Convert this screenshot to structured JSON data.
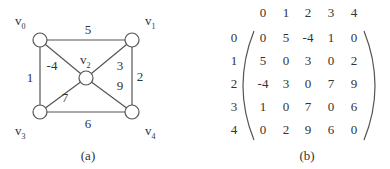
{
  "graph": {
    "caption": "(a)",
    "vertices": [
      {
        "id": 0,
        "label": "v",
        "sub": "0"
      },
      {
        "id": 1,
        "label": "v",
        "sub": "1"
      },
      {
        "id": 2,
        "label": "v",
        "sub": "2"
      },
      {
        "id": 3,
        "label": "v",
        "sub": "3"
      },
      {
        "id": 4,
        "label": "v",
        "sub": "4"
      }
    ],
    "edges": [
      {
        "from": 0,
        "to": 1,
        "weight": "5"
      },
      {
        "from": 0,
        "to": 3,
        "weight": "1"
      },
      {
        "from": 0,
        "to": 2,
        "weight": "-4"
      },
      {
        "from": 1,
        "to": 2,
        "weight": "3"
      },
      {
        "from": 1,
        "to": 4,
        "weight": "2"
      },
      {
        "from": 2,
        "to": 3,
        "weight": "7"
      },
      {
        "from": 2,
        "to": 4,
        "weight": "9"
      },
      {
        "from": 3,
        "to": 4,
        "weight": "6"
      }
    ]
  },
  "matrix": {
    "caption": "(b)",
    "col_headers": [
      "0",
      "1",
      "2",
      "3",
      "4"
    ],
    "row_headers": [
      "0",
      "1",
      "2",
      "3",
      "4"
    ],
    "rows": [
      [
        "0",
        "5",
        "-4",
        "1",
        "0"
      ],
      [
        "5",
        "0",
        "3",
        "0",
        "2"
      ],
      [
        "-4",
        "3",
        "0",
        "7",
        "9"
      ],
      [
        "1",
        "0",
        "7",
        "0",
        "6"
      ],
      [
        "0",
        "2",
        "9",
        "6",
        "0"
      ]
    ]
  }
}
